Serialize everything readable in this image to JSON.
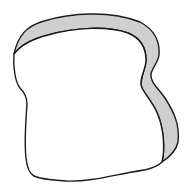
{
  "image": {
    "subject": "bread-slice",
    "colors": {
      "background": "#ffffff",
      "crust_fill": "#cfcfcf",
      "body_fill": "#ffffff",
      "outline": "#1a1a1a"
    }
  }
}
